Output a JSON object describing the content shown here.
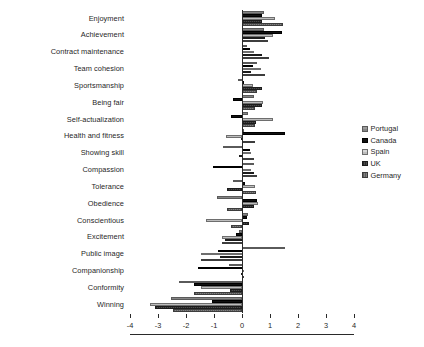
{
  "chart_data": {
    "type": "bar",
    "orientation": "horizontal",
    "title": "",
    "subtitle": "",
    "xlabel": "",
    "ylabel": "",
    "xlim": [
      -4,
      4
    ],
    "xticks": [
      -4,
      -3,
      -2,
      -1,
      0,
      1,
      2,
      3,
      4
    ],
    "xtick_labels": [
      "-4",
      "-3",
      "-2",
      "-1",
      "0",
      "1",
      "2",
      "3",
      "4"
    ],
    "grid": false,
    "legend_position": "right",
    "categories": [
      "Enjoyment",
      "Achievement",
      "Contract maintenance",
      "Team cohesion",
      "Sportsmanship",
      "Being fair",
      "Self-actualization",
      "Health and fitness",
      "Showing skill",
      "Compassion",
      "Tolerance",
      "Obedience",
      "Conscientious",
      "Excitement",
      "Public image",
      "Companionship",
      "Conformity",
      "Winning"
    ],
    "series": [
      {
        "name": "Portugal",
        "color": "#8f8f8f",
        "values": [
          0.78,
          0.78,
          0.18,
          0.55,
          -0.16,
          0.42,
          0.22,
          0.02,
          -0.68,
          0.42,
          -0.32,
          -0.88,
          0.22,
          -0.12,
          1.55,
          -0.45,
          -2.25,
          -2.55
        ]
      },
      {
        "name": "Canada",
        "color": "#111111",
        "values": [
          0.72,
          1.42,
          0.3,
          0.38,
          0.05,
          -0.32,
          -0.38,
          1.52,
          0.28,
          -1.05,
          0.12,
          0.52,
          0.18,
          -0.2,
          -0.85,
          -1.58,
          -1.72,
          -1.08
        ]
      },
      {
        "name": "Spain",
        "color": "#c8c8c8",
        "values": [
          1.18,
          1.12,
          0.42,
          0.68,
          0.4,
          0.75,
          1.12,
          -0.58,
          0.32,
          0.32,
          0.48,
          0.58,
          -1.3,
          -0.72,
          -1.45,
          0.0,
          -1.45,
          -3.3
        ]
      },
      {
        "name": "UK",
        "color": "#3a3a3a",
        "values": [
          0.72,
          0.82,
          0.72,
          0.32,
          0.72,
          0.72,
          0.5,
          -0.02,
          -0.1,
          0.42,
          -0.55,
          0.42,
          0.25,
          -0.62,
          -0.8,
          -0.02,
          -0.42,
          -3.12
        ]
      },
      {
        "name": "Germany",
        "color": "#6f6f6f",
        "values": [
          1.48,
          0.92,
          0.95,
          0.82,
          0.52,
          0.48,
          0.48,
          0.48,
          0.42,
          0.52,
          0.5,
          -0.55,
          -0.38,
          -0.7,
          -1.48,
          0.0,
          -1.72,
          -2.48
        ]
      }
    ]
  },
  "legend": {
    "items": [
      {
        "label": "Portugal"
      },
      {
        "label": "Canada"
      },
      {
        "label": "Spain"
      },
      {
        "label": "UK"
      },
      {
        "label": "Germany"
      }
    ]
  }
}
